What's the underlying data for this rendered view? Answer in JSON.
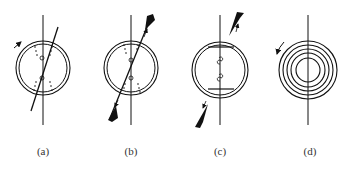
{
  "figure": {
    "stroke_color": "#111111",
    "background": "#ffffff",
    "panels": [
      {
        "id": "a",
        "label": "(a)",
        "description": "Double circle crossed by vertical axis and a tilted line; dotted field patterns near two small loops; curved arrow top-left"
      },
      {
        "id": "b",
        "label": "(b)",
        "description": "Double circle with tilted line extending out with filled jet cones at both ends and arrows; dotted patterns near loops"
      },
      {
        "id": "c",
        "label": "(c)",
        "description": "Double circle with two horizontal chord plates and two small loops on vertical axis; detached jet cones with arrows outside"
      },
      {
        "id": "d",
        "label": "(d)",
        "description": "Concentric circles (spiral-like rings) on vertical axis with curved arrow at upper-left"
      }
    ]
  }
}
